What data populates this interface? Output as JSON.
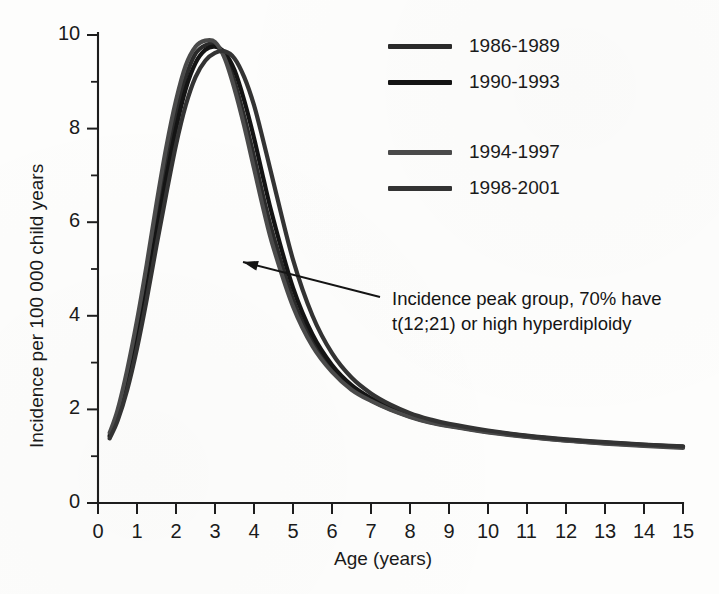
{
  "chart_data": {
    "type": "line",
    "title": "",
    "xlabel": "Age (years)",
    "ylabel": "Incidence per 100 000 child years",
    "xlim": [
      0,
      15
    ],
    "ylim": [
      0,
      10
    ],
    "xticks": [
      "0",
      "1",
      "2",
      "3",
      "4",
      "5",
      "6",
      "7",
      "8",
      "9",
      "10",
      "11",
      "12",
      "13",
      "14",
      "15"
    ],
    "yticks": [
      "0",
      "2",
      "4",
      "6",
      "8",
      "10"
    ],
    "yminorticks": [
      1,
      3,
      5,
      7,
      9
    ],
    "grid": false,
    "legend_position": "upper-right-inside",
    "x": [
      0.3,
      0.5,
      0.75,
      1.0,
      1.25,
      1.5,
      1.75,
      2.0,
      2.25,
      2.5,
      2.75,
      3.0,
      3.25,
      3.5,
      3.75,
      4.0,
      4.25,
      4.5,
      5.0,
      5.5,
      6.0,
      6.5,
      7.0,
      7.5,
      8.0,
      8.5,
      9.0,
      10.0,
      11.0,
      12.0,
      13.0,
      14.0,
      15.0
    ],
    "series": [
      {
        "name": "1986-1989",
        "color": "#2a2a2a",
        "peak_age": 3.1,
        "peak_value": 9.8,
        "values": [
          1.45,
          1.9,
          2.7,
          3.7,
          4.85,
          6.1,
          7.25,
          8.3,
          9.1,
          9.6,
          9.78,
          9.8,
          9.55,
          9.0,
          8.25,
          7.4,
          6.5,
          5.7,
          4.35,
          3.45,
          2.85,
          2.45,
          2.2,
          2.0,
          1.85,
          1.73,
          1.65,
          1.52,
          1.42,
          1.34,
          1.28,
          1.23,
          1.2
        ]
      },
      {
        "name": "1990-1993",
        "color": "#141414",
        "peak_age": 3.3,
        "peak_value": 9.75,
        "values": [
          1.42,
          1.82,
          2.55,
          3.5,
          4.6,
          5.8,
          6.95,
          8.0,
          8.85,
          9.4,
          9.68,
          9.75,
          9.62,
          9.25,
          8.6,
          7.8,
          6.9,
          6.05,
          4.6,
          3.6,
          2.95,
          2.52,
          2.24,
          2.03,
          1.87,
          1.75,
          1.66,
          1.53,
          1.43,
          1.35,
          1.29,
          1.24,
          1.2
        ]
      },
      {
        "name": "1994-1997",
        "color": "#4a4a4a",
        "peak_age": 3.05,
        "peak_value": 9.9,
        "values": [
          1.5,
          1.98,
          2.85,
          3.9,
          5.1,
          6.4,
          7.6,
          8.6,
          9.35,
          9.75,
          9.88,
          9.85,
          9.5,
          8.85,
          8.05,
          7.15,
          6.25,
          5.45,
          4.2,
          3.35,
          2.8,
          2.42,
          2.18,
          1.99,
          1.84,
          1.72,
          1.64,
          1.51,
          1.41,
          1.33,
          1.27,
          1.22,
          1.18
        ]
      },
      {
        "name": "1998-2001",
        "color": "#333333",
        "peak_age": 3.55,
        "peak_value": 9.65,
        "values": [
          1.38,
          1.75,
          2.42,
          3.3,
          4.35,
          5.5,
          6.6,
          7.65,
          8.5,
          9.1,
          9.45,
          9.62,
          9.65,
          9.5,
          9.1,
          8.5,
          7.7,
          6.85,
          5.2,
          4.0,
          3.2,
          2.68,
          2.34,
          2.1,
          1.92,
          1.79,
          1.69,
          1.55,
          1.44,
          1.36,
          1.3,
          1.25,
          1.21
        ]
      }
    ],
    "annotations": [
      {
        "name": "incidence-peak-callout",
        "line1": "Incidence peak group, 70% have",
        "line2": "t(12;21) or high hyperdiploidy",
        "arrow_from": [
          380,
          297
        ],
        "arrow_to": [
          243,
          262
        ]
      }
    ]
  },
  "axes": {
    "ylabel": "Incidence per 100 000 child years",
    "xlabel": "Age (years)",
    "ytick_labels": [
      "10",
      "8",
      "6",
      "4",
      "2",
      "0"
    ],
    "xtick_labels": [
      "0",
      "1",
      "2",
      "3",
      "4",
      "5",
      "6",
      "7",
      "8",
      "9",
      "10",
      "11",
      "12",
      "13",
      "14",
      "15"
    ]
  },
  "legend": {
    "items": [
      {
        "label": "1986-1989",
        "color": "#2a2a2a"
      },
      {
        "label": "1990-1993",
        "color": "#141414"
      },
      {
        "label": "1994-1997",
        "color": "#4a4a4a"
      },
      {
        "label": "1998-2001",
        "color": "#333333"
      }
    ]
  },
  "annotation": {
    "line1": "Incidence peak group, 70% have",
    "line2": "t(12;21) or high hyperdiploidy"
  }
}
